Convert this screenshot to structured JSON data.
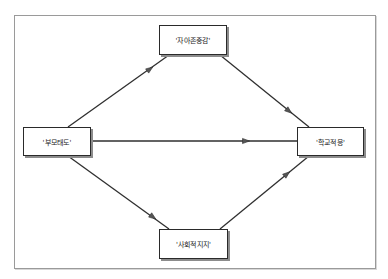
{
  "diagram": {
    "type": "path-model",
    "nodes": [
      {
        "id": "parent",
        "label": "'부모태도'",
        "x": 23,
        "y": 127,
        "w": 68,
        "h": 29
      },
      {
        "id": "self_esteem",
        "label": "'자아존중감'",
        "x": 159,
        "y": 25,
        "w": 68,
        "h": 30
      },
      {
        "id": "social_support",
        "label": "'사회적지지'",
        "x": 159,
        "y": 229,
        "w": 69,
        "h": 30
      },
      {
        "id": "school_adj",
        "label": "'학교적응'",
        "x": 297,
        "y": 127,
        "w": 67,
        "h": 29
      }
    ],
    "edges": [
      {
        "from": "parent",
        "to": "self_esteem",
        "x1": 68,
        "y1": 127,
        "x2": 169,
        "y2": 55,
        "ax": 150,
        "ay": 69
      },
      {
        "from": "self_esteem",
        "to": "school_adj",
        "x1": 220,
        "y1": 55,
        "x2": 309,
        "y2": 127,
        "ax": 289,
        "ay": 111
      },
      {
        "from": "parent",
        "to": "school_adj",
        "x1": 91,
        "y1": 141,
        "x2": 297,
        "y2": 141,
        "ax": 246,
        "ay": 141
      },
      {
        "from": "parent",
        "to": "social_support",
        "x1": 68,
        "y1": 156,
        "x2": 169,
        "y2": 229,
        "ax": 153,
        "ay": 217
      },
      {
        "from": "social_support",
        "to": "school_adj",
        "x1": 220,
        "y1": 229,
        "x2": 309,
        "y2": 156,
        "ax": 287,
        "ay": 174
      }
    ]
  },
  "colors": {
    "line": "#2f2f2f",
    "arrow": "#555555",
    "frame": "#9a9a9a"
  }
}
